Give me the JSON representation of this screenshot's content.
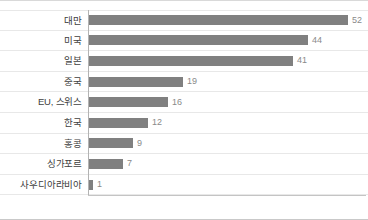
{
  "chart_data": {
    "type": "bar",
    "orientation": "horizontal",
    "title": "",
    "subtitle": "",
    "xlabel": "",
    "ylabel": "",
    "categories": [
      "대만",
      "미국",
      "일본",
      "중국",
      "EU, 스위스",
      "한국",
      "홍콩",
      "싱가포르",
      "사우디아라비아"
    ],
    "values": [
      52,
      44,
      41,
      19,
      16,
      12,
      9,
      7,
      1
    ],
    "value_labels": [
      "52",
      "44",
      "41",
      "19",
      "16",
      "12",
      "9",
      "7",
      "1"
    ],
    "xlim": [
      0,
      52
    ],
    "grid": "horizontal-row-separators",
    "legend": "none",
    "bar_color": "#808080",
    "label_color": "#404040",
    "value_color": "#8a8a8a",
    "axis_color": "#b3b3b3",
    "gridline_color": "#e8e8e8"
  },
  "rows": [
    {
      "label": "대만",
      "value": "52"
    },
    {
      "label": "미국",
      "value": "44"
    },
    {
      "label": "일본",
      "value": "41"
    },
    {
      "label": "중국",
      "value": "19"
    },
    {
      "label": "EU, 스위스",
      "value": "16"
    },
    {
      "label": "한국",
      "value": "12"
    },
    {
      "label": "홍콩",
      "value": "9"
    },
    {
      "label": "싱가포르",
      "value": "7"
    },
    {
      "label": "사우디아라비아",
      "value": "1"
    }
  ]
}
